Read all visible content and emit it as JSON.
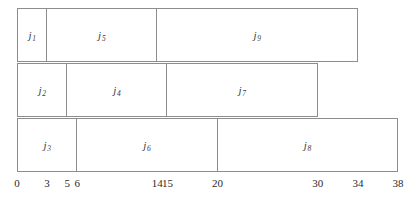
{
  "chart_data": {
    "type": "bar",
    "title": "",
    "subtitle": "",
    "xlabel": "",
    "ylabel": "",
    "orientation": "horizontal",
    "grid": false,
    "legend": false,
    "xlim": [
      0,
      38
    ],
    "x_ticks": [
      0,
      3,
      5,
      6,
      14,
      15,
      20,
      30,
      34,
      38
    ],
    "x_tick_labels": [
      "0",
      "3",
      "5",
      "6",
      "14",
      "15",
      "20",
      "30",
      "34",
      "38"
    ],
    "rows": [
      {
        "row_index": 0,
        "bars": [
          {
            "label": "j",
            "subscript": "1",
            "start": 0,
            "end": 3,
            "duration": 3
          },
          {
            "label": "j",
            "subscript": "5",
            "start": 3,
            "end": 14,
            "duration": 11
          },
          {
            "label": "j",
            "subscript": "9",
            "start": 14,
            "end": 34,
            "duration": 20
          }
        ]
      },
      {
        "row_index": 1,
        "bars": [
          {
            "label": "j",
            "subscript": "2",
            "start": 0,
            "end": 5,
            "duration": 5
          },
          {
            "label": "j",
            "subscript": "4",
            "start": 5,
            "end": 15,
            "duration": 10
          },
          {
            "label": "j",
            "subscript": "7",
            "start": 15,
            "end": 30,
            "duration": 15
          }
        ]
      },
      {
        "row_index": 2,
        "bars": [
          {
            "label": "j",
            "subscript": "3",
            "start": 0,
            "end": 6,
            "duration": 6
          },
          {
            "label": "j",
            "subscript": "6",
            "start": 6,
            "end": 20,
            "duration": 14
          },
          {
            "label": "j",
            "subscript": "8",
            "start": 20,
            "end": 38,
            "duration": 18
          }
        ]
      }
    ],
    "colors": {
      "bar_fill": "#ffffff",
      "bar_border": "#8d8d8d",
      "text": "#2b2b2b",
      "background": "#ffffff"
    }
  },
  "layout": {
    "plot_left_px": 17,
    "plot_right_px": 398,
    "row_top_px": [
      8,
      63,
      118
    ],
    "row_height_px": 54,
    "axis_top_px": 176
  }
}
